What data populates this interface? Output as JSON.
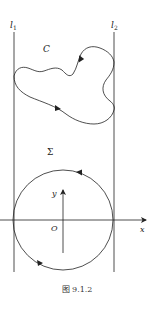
{
  "figure": {
    "caption": "图 9.1.2",
    "stroke_color": "#222222",
    "background": "#ffffff"
  },
  "labels": {
    "line_left": "l",
    "line_left_sub": "1",
    "line_right": "l",
    "line_right_sub": "2",
    "curve": "C",
    "region": "Σ",
    "axis_x": "x",
    "axis_y": "y",
    "origin": "O"
  },
  "geometry": {
    "line_left_x": 14,
    "line_right_x": 114,
    "line_top_y": 32,
    "line_bottom_y": 272,
    "circle_center": [
      63,
      220
    ],
    "circle_radius": 50,
    "x_axis": {
      "from": [
        0,
        220
      ],
      "to": [
        148,
        220
      ]
    },
    "y_axis": {
      "from": [
        63,
        253
      ],
      "to": [
        63,
        188
      ]
    }
  },
  "elements": [
    {
      "id": "line-l1",
      "type": "vertical-line",
      "label": "l1"
    },
    {
      "id": "line-l2",
      "type": "vertical-line",
      "label": "l2"
    },
    {
      "id": "curve-C",
      "type": "closed-curve",
      "label": "C",
      "orientation": "clockwise-arrows"
    },
    {
      "id": "circle",
      "type": "circle",
      "orientation": "counterclockwise"
    },
    {
      "id": "x-axis",
      "type": "axis",
      "label": "x"
    },
    {
      "id": "y-axis",
      "type": "axis",
      "label": "y"
    }
  ]
}
